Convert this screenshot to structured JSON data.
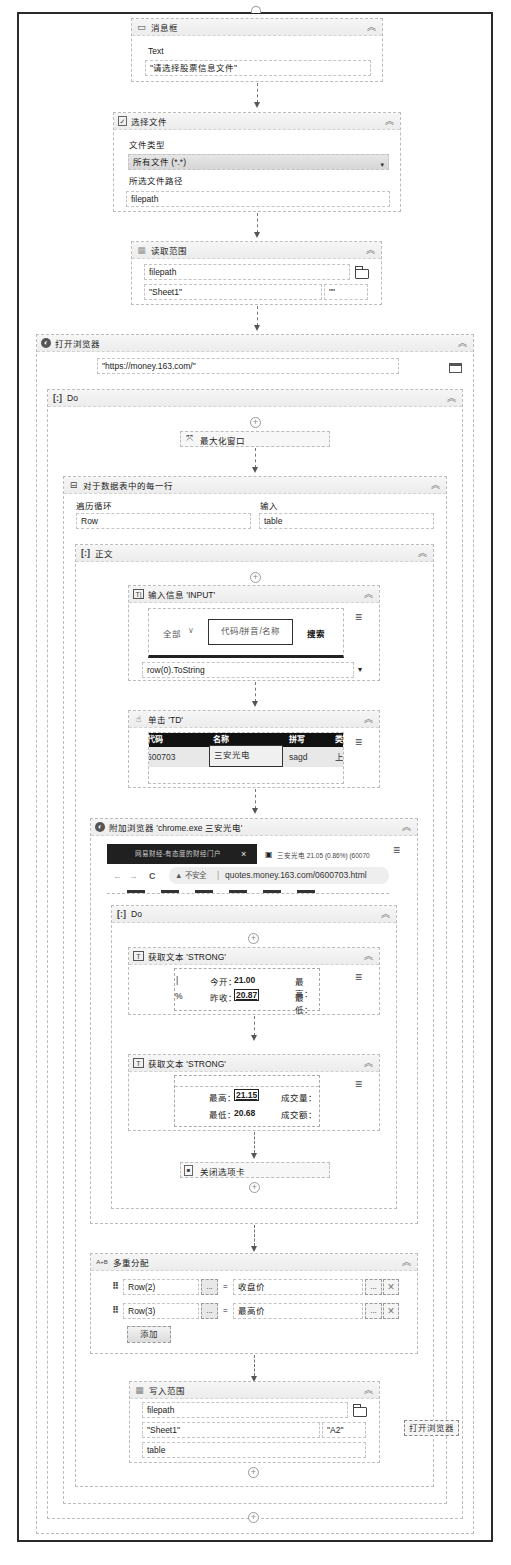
{
  "message_box": {
    "title": "消息框",
    "text_label": "Text",
    "text_value": "\"请选择股票信息文件\""
  },
  "select_file": {
    "title": "选择文件",
    "file_type_label": "文件类型",
    "file_type_value": "所有文件 (*.*)",
    "path_label": "所选文件路径",
    "path_value": "filepath"
  },
  "read_range": {
    "title": "读取范围",
    "workbook": "filepath",
    "sheet": "\"Sheet1\"",
    "range": "\"\""
  },
  "open_browser": {
    "title": "打开浏览器",
    "url": "\"https://money.163.com/\"",
    "tooltip": "打开浏览器"
  },
  "do1": {
    "title": "Do"
  },
  "maximize": {
    "title": "最大化窗口"
  },
  "for_each_row": {
    "title": "对于数据表中的每一行",
    "iterate_label": "遍历循环",
    "iterate_value": "Row",
    "input_label": "输入",
    "input_value": "table"
  },
  "body": {
    "title": "正文"
  },
  "type_into": {
    "title": "输入信息 'INPUT'",
    "preview_dropdown": "全部",
    "preview_input_placeholder": "代码/拼音/名称",
    "preview_search": "搜索",
    "value": "row(0).ToString"
  },
  "click_td": {
    "title": "单击 'TD'",
    "headers": [
      "代码",
      "名称",
      "拼写",
      "类"
    ],
    "row": [
      "600703",
      "三安光电",
      "sagd",
      "上"
    ]
  },
  "attach_browser": {
    "title": "附加浏览器 'chrome.exe 三安光电'",
    "tab1": "网易财经-有态度的财经门户",
    "tab1_close": "×",
    "tab2": "三安光电 21.05 (0.86%) (60070",
    "nav_back": "←",
    "nav_forward": "→",
    "nav_reload": "C",
    "insecure": "▲ 不安全",
    "address": "quotes.money.163.com/0600703.html"
  },
  "do2": {
    "title": "Do"
  },
  "get_text1": {
    "title": "获取文本 'STRONG'",
    "line1_label": "今开：",
    "line1_value": "21.00",
    "line1_right": "最高：",
    "line2_left": "%",
    "line2_label": "昨收：",
    "line2_value": "20.87",
    "line2_right": "最低："
  },
  "get_text2": {
    "title": "获取文本 'STRONG'",
    "line1_label": "最高：",
    "line1_value": "21.15",
    "line1_right": "成交量：",
    "line2_label": "最低：",
    "line2_value": "20.68",
    "line2_right": "成交额："
  },
  "close_tab": {
    "title": "关闭选项卡"
  },
  "multiple_assign": {
    "title": "多重分配",
    "rows": [
      {
        "left": "Row(2)",
        "right": "收盘价"
      },
      {
        "left": "Row(3)",
        "right": "最高价"
      }
    ],
    "ellipsis": "...",
    "equals": "=",
    "remove": "×",
    "add_label": "添加"
  },
  "write_range": {
    "title": "写入范围",
    "workbook": "filepath",
    "sheet": "\"Sheet1\"",
    "start_cell": "\"A2\"",
    "datatable": "table"
  },
  "icons": {
    "collapse": "≈",
    "plus": "+",
    "menu": "≡",
    "dropdown": "▾"
  }
}
